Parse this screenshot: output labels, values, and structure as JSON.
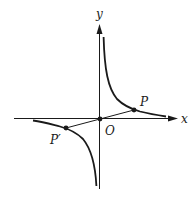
{
  "diagram": {
    "title": "",
    "origin_px": [
      100,
      119
    ],
    "axes": {
      "x_label": "x",
      "y_label": "y",
      "origin_label": "O"
    },
    "curve": {
      "type": "hyperbola",
      "description": "y = k/x, both branches",
      "k_px": 300
    },
    "points": [
      {
        "name": "P",
        "label": "P",
        "px": [
          134,
          110
        ]
      },
      {
        "name": "P_prime",
        "label": "P′",
        "px": [
          66,
          128
        ]
      },
      {
        "name": "O",
        "label": "O",
        "px": [
          100,
          119
        ]
      }
    ],
    "segment": {
      "from": "P_prime",
      "to": "P",
      "through": "O"
    },
    "colors": {
      "ink": "#1a1a1a",
      "background": "#ffffff"
    }
  }
}
